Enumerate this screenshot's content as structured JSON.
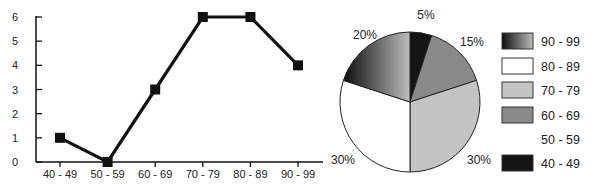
{
  "chart_data": [
    {
      "type": "line",
      "title": "",
      "xlabel": "",
      "ylabel": "",
      "categories": [
        "40 - 49",
        "50 - 59",
        "60 - 69",
        "70 - 79",
        "80 - 89",
        "90 - 99"
      ],
      "values": [
        1,
        0,
        3,
        6,
        6,
        4
      ],
      "yticks": [
        "0",
        "1",
        "2",
        "3",
        "4",
        "5",
        "6"
      ],
      "ylim": [
        0,
        6
      ],
      "marker": "square",
      "grid": false,
      "line_color": "#111111"
    },
    {
      "type": "pie",
      "title": "",
      "slices": [
        {
          "label": "40 - 49",
          "value": 5,
          "display": "5%",
          "color": "#141414"
        },
        {
          "label": "60 - 69",
          "value": 15,
          "display": "15%",
          "color": "#8a8a8a"
        },
        {
          "label": "70 - 79",
          "value": 30,
          "display": "30%",
          "color": "#c4c4c4"
        },
        {
          "label": "80 - 89",
          "value": 30,
          "display": "30%",
          "color": "#ffffff"
        },
        {
          "label": "90 - 99",
          "value": 20,
          "display": "20%",
          "color": "gradient"
        }
      ],
      "legend": [
        {
          "label": "90 - 99",
          "swatch": "gradient"
        },
        {
          "label": "80 - 89",
          "swatch": "#ffffff"
        },
        {
          "label": "70 - 79",
          "swatch": "#c4c4c4"
        },
        {
          "label": "60 - 69",
          "swatch": "#8a8a8a"
        },
        {
          "label": "50 - 59",
          "swatch": "none"
        },
        {
          "label": "40 - 49",
          "swatch": "#141414"
        }
      ],
      "legend_position": "right"
    }
  ]
}
